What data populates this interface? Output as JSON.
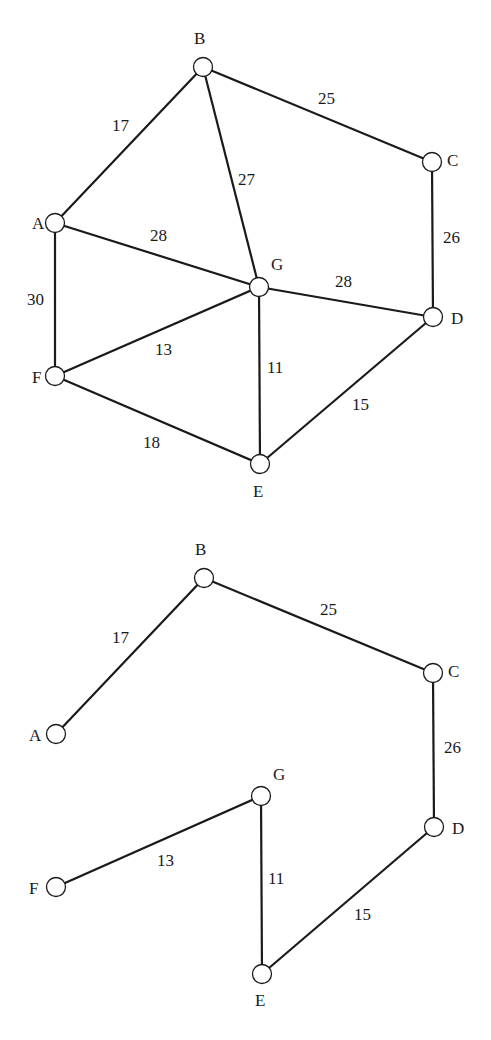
{
  "colors": {
    "stroke": "#1a1a1a",
    "background": "#ffffff"
  },
  "graphs": [
    {
      "name": "full-network",
      "nodes": [
        {
          "id": "A",
          "x": 55,
          "y": 223,
          "lx": 32,
          "ly": 229
        },
        {
          "id": "B",
          "x": 203,
          "y": 67,
          "lx": 194,
          "ly": 44
        },
        {
          "id": "C",
          "x": 432,
          "y": 162,
          "lx": 447,
          "ly": 166
        },
        {
          "id": "D",
          "x": 433,
          "y": 317,
          "lx": 451,
          "ly": 324
        },
        {
          "id": "E",
          "x": 260,
          "y": 464,
          "lx": 253,
          "ly": 497
        },
        {
          "id": "F",
          "x": 55,
          "y": 376,
          "lx": 32,
          "ly": 383
        },
        {
          "id": "G",
          "x": 259,
          "y": 287,
          "lx": 271,
          "ly": 270
        }
      ],
      "edges": [
        {
          "from": "A",
          "to": "B",
          "weight": "17",
          "lx": 112,
          "ly": 131
        },
        {
          "from": "B",
          "to": "C",
          "weight": "25",
          "lx": 318,
          "ly": 104
        },
        {
          "from": "B",
          "to": "G",
          "weight": "27",
          "lx": 238,
          "ly": 185
        },
        {
          "from": "A",
          "to": "G",
          "weight": "28",
          "lx": 150,
          "ly": 241
        },
        {
          "from": "C",
          "to": "D",
          "weight": "26",
          "lx": 443,
          "ly": 243
        },
        {
          "from": "G",
          "to": "D",
          "weight": "28",
          "lx": 335,
          "ly": 287
        },
        {
          "from": "A",
          "to": "F",
          "weight": "30",
          "lx": 27,
          "ly": 305
        },
        {
          "from": "F",
          "to": "G",
          "weight": "13",
          "lx": 155,
          "ly": 355
        },
        {
          "from": "G",
          "to": "E",
          "weight": "11",
          "lx": 267,
          "ly": 373
        },
        {
          "from": "E",
          "to": "D",
          "weight": "15",
          "lx": 352,
          "ly": 410
        },
        {
          "from": "F",
          "to": "E",
          "weight": "18",
          "lx": 143,
          "ly": 448
        }
      ]
    },
    {
      "name": "minimum-spanning-tree",
      "nodes": [
        {
          "id": "A",
          "x": 56,
          "y": 734,
          "lx": 29,
          "ly": 741
        },
        {
          "id": "B",
          "x": 204,
          "y": 578,
          "lx": 195,
          "ly": 555
        },
        {
          "id": "C",
          "x": 433,
          "y": 673,
          "lx": 448,
          "ly": 677
        },
        {
          "id": "D",
          "x": 434,
          "y": 827,
          "lx": 452,
          "ly": 834
        },
        {
          "id": "E",
          "x": 262,
          "y": 974,
          "lx": 255,
          "ly": 1006
        },
        {
          "id": "F",
          "x": 56,
          "y": 887,
          "lx": 29,
          "ly": 894
        },
        {
          "id": "G",
          "x": 261,
          "y": 796,
          "lx": 273,
          "ly": 780
        }
      ],
      "edges": [
        {
          "from": "A",
          "to": "B",
          "weight": "17",
          "lx": 112,
          "ly": 643
        },
        {
          "from": "B",
          "to": "C",
          "weight": "25",
          "lx": 320,
          "ly": 615
        },
        {
          "from": "C",
          "to": "D",
          "weight": "26",
          "lx": 444,
          "ly": 753
        },
        {
          "from": "F",
          "to": "G",
          "weight": "13",
          "lx": 157,
          "ly": 866
        },
        {
          "from": "G",
          "to": "E",
          "weight": "11",
          "lx": 268,
          "ly": 884
        },
        {
          "from": "E",
          "to": "D",
          "weight": "15",
          "lx": 354,
          "ly": 920
        }
      ]
    }
  ]
}
